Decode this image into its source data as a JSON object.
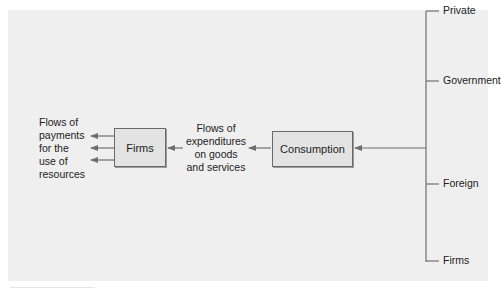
{
  "diagram": {
    "boxes": {
      "firms": "Firms",
      "consumption": "Consumption"
    },
    "labels": {
      "payments": [
        "Flows of",
        "payments",
        "for the",
        "use of",
        "resources"
      ],
      "expenditures": [
        "Flows of",
        "expenditures",
        "on goods",
        "and services"
      ]
    },
    "sources": [
      {
        "label": "Private",
        "y": 11
      },
      {
        "label": "Government",
        "y": 81
      },
      {
        "label": "Foreign",
        "y": 184
      },
      {
        "label": "Firms",
        "y": 261
      }
    ],
    "colors": {
      "background": "#efefef",
      "box_fill": "#e3e3e3",
      "line": "#6e6e6e",
      "text": "#222222"
    }
  }
}
